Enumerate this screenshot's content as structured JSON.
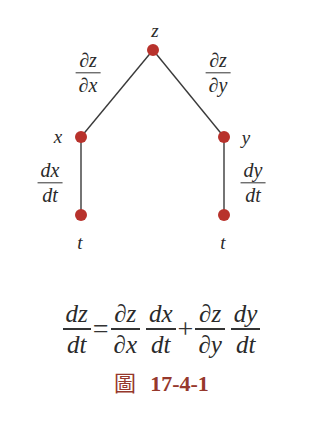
{
  "colors": {
    "node": "#b8322c",
    "edge": "#3a3a3a",
    "text": "#2a2a2a",
    "caption": "#96382c"
  },
  "tree": {
    "nodes": [
      {
        "id": "z",
        "label": "z",
        "x": 153,
        "y": 50
      },
      {
        "id": "x",
        "label": "x",
        "x": 81,
        "y": 137
      },
      {
        "id": "y",
        "label": "y",
        "x": 224,
        "y": 137
      },
      {
        "id": "t1",
        "label": "t",
        "x": 81,
        "y": 215
      },
      {
        "id": "t2",
        "label": "t",
        "x": 224,
        "y": 215
      }
    ],
    "edges": [
      {
        "from": "z",
        "to": "x",
        "num": "∂z",
        "den": "∂x"
      },
      {
        "from": "z",
        "to": "y",
        "num": "∂z",
        "den": "∂y"
      },
      {
        "from": "x",
        "to": "t1",
        "num": "dx",
        "den": "dt"
      },
      {
        "from": "y",
        "to": "t2",
        "num": "dy",
        "den": "dt"
      }
    ]
  },
  "formula": {
    "lhs": {
      "num": "dz",
      "den": "dt"
    },
    "equals": "=",
    "term1": {
      "f1": {
        "num": "∂z",
        "den": "∂x"
      },
      "f2": {
        "num": "dx",
        "den": "dt"
      }
    },
    "plus": "+",
    "term2": {
      "f1": {
        "num": "∂z",
        "den": "∂y"
      },
      "f2": {
        "num": "dy",
        "den": "dt"
      }
    }
  },
  "caption": {
    "prefix": "圖",
    "number": "17-4-1"
  }
}
